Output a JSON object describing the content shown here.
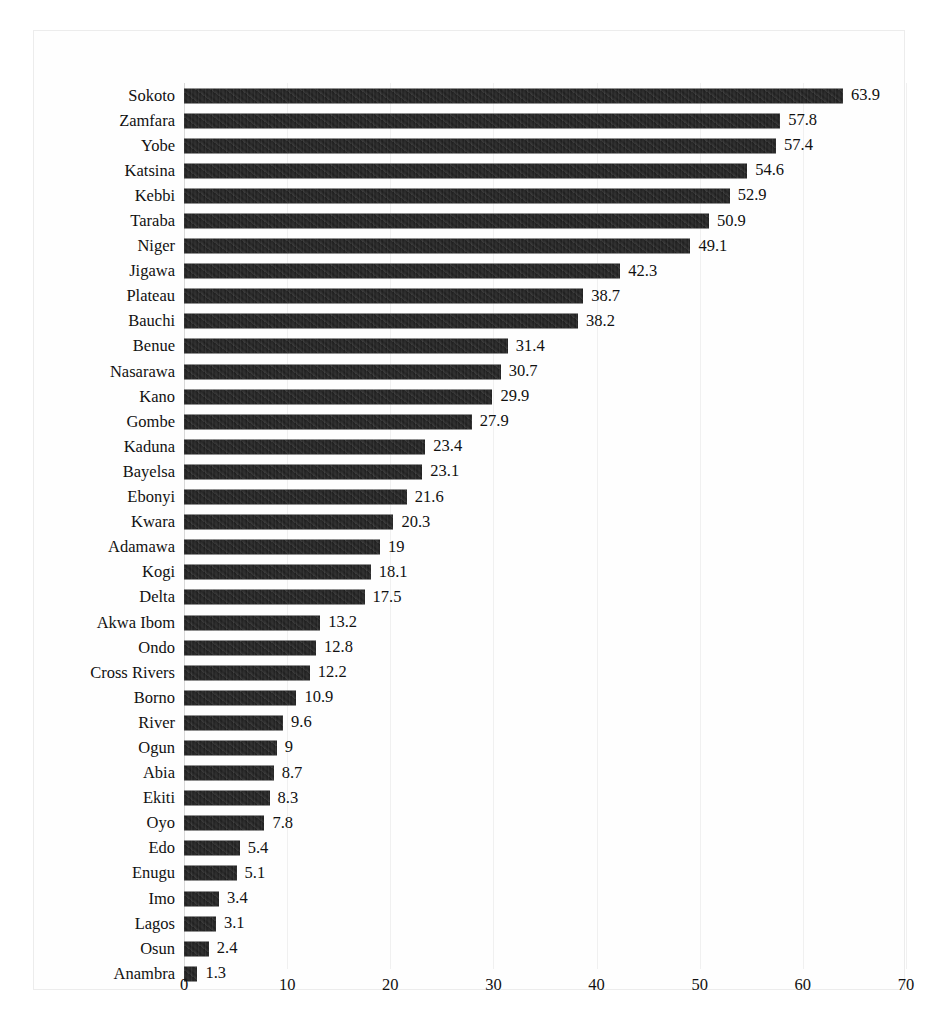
{
  "chart_data": {
    "type": "bar",
    "orientation": "horizontal",
    "title": "",
    "subtitle": "",
    "xlabel": "",
    "ylabel": "",
    "xlim": [
      0,
      70
    ],
    "xticks": [
      0,
      10,
      20,
      30,
      40,
      50,
      60,
      70
    ],
    "xtick_labels": [
      "0",
      "10",
      "20",
      "30",
      "40",
      "50",
      "60",
      "70"
    ],
    "grid": true,
    "grid_axis": "x",
    "legend": false,
    "legend_position": "none",
    "bar_color": "#1b1b1b",
    "data_labels": true,
    "categories": [
      "Sokoto",
      "Zamfara",
      "Yobe",
      "Katsina",
      "Kebbi",
      "Taraba",
      "Niger",
      "Jigawa",
      "Plateau",
      "Bauchi",
      "Benue",
      "Nasarawa",
      "Kano",
      "Gombe",
      "Kaduna",
      "Bayelsa",
      "Ebonyi",
      "Kwara",
      "Adamawa",
      "Kogi",
      "Delta",
      "Akwa Ibom",
      "Ondo",
      "Cross Rivers",
      "Borno",
      "River",
      "Ogun",
      "Abia",
      "Ekiti",
      "Oyo",
      "Edo",
      "Enugu",
      "Imo",
      "Lagos",
      "Osun",
      "Anambra"
    ],
    "values": [
      63.9,
      57.8,
      57.4,
      54.6,
      52.9,
      50.9,
      49.1,
      42.3,
      38.7,
      38.2,
      31.4,
      30.7,
      29.9,
      27.9,
      23.4,
      23.1,
      21.6,
      20.3,
      19,
      18.1,
      17.5,
      13.2,
      12.8,
      12.2,
      10.9,
      9.6,
      9,
      8.7,
      8.3,
      7.8,
      5.4,
      5.1,
      3.4,
      3.1,
      2.4,
      1.3
    ],
    "value_labels": [
      "63.9",
      "57.8",
      "57.4",
      "54.6",
      "52.9",
      "50.9",
      "49.1",
      "42.3",
      "38.7",
      "38.2",
      "31.4",
      "30.7",
      "29.9",
      "27.9",
      "23.4",
      "23.1",
      "21.6",
      "20.3",
      "19",
      "18.1",
      "17.5",
      "13.2",
      "12.8",
      "12.2",
      "10.9",
      "9.6",
      "9",
      "8.7",
      "8.3",
      "7.8",
      "5.4",
      "5.1",
      "3.4",
      "3.1",
      "2.4",
      "1.3"
    ]
  }
}
